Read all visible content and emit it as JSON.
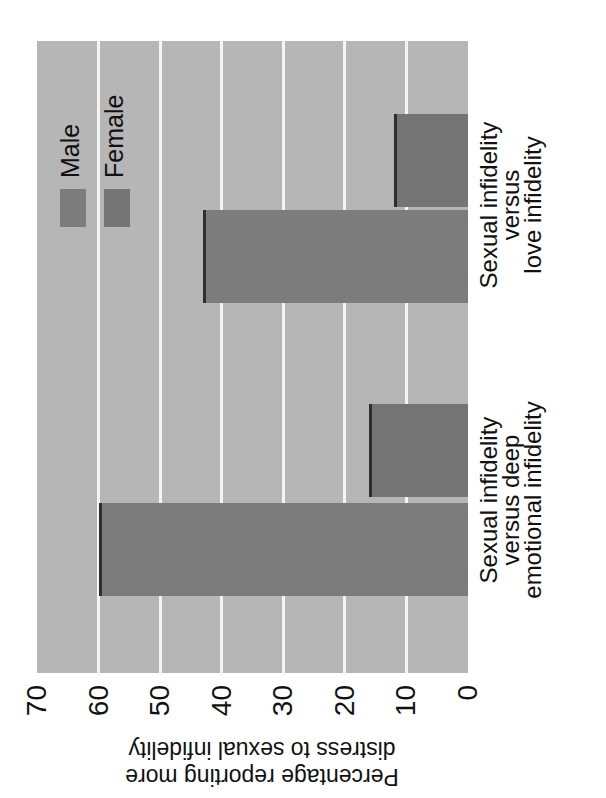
{
  "chart_data": {
    "type": "bar",
    "orientation": "vertical bar chart displayed rotated 90 degrees counter-clockwise",
    "title": "",
    "xlabel": "",
    "ylabel": "Percentage reporting more distress to sexual infidelity",
    "ylabel_lines": [
      "Percentage reporting more",
      "distress to sexual infidelity"
    ],
    "categories": [
      "Sexual infidelity versus deep emotional infidelity",
      "Sexual infidelity versus love infidelity"
    ],
    "category_lines": [
      [
        "Sexual infidelity",
        "versus deep",
        "emotional infidelity"
      ],
      [
        "Sexual infidelity",
        "versus",
        "love infidelity"
      ]
    ],
    "series": [
      {
        "name": "Male",
        "values": [
          60,
          43
        ],
        "color": "#7c7c7c"
      },
      {
        "name": "Female",
        "values": [
          16,
          12
        ],
        "color": "#747474"
      }
    ],
    "ylim": [
      0,
      70
    ],
    "yticks": [
      0,
      10,
      20,
      30,
      40,
      50,
      60,
      70
    ],
    "grid": true,
    "legend_position": "upper right (of unrotated chart)",
    "plot_background": "#b6b6b6",
    "gridline_color": "#f4f4f4"
  },
  "legend": {
    "items": [
      {
        "label": "Male",
        "color": "#7c7c7c"
      },
      {
        "label": "Female",
        "color": "#747474"
      }
    ]
  },
  "axis": {
    "title_line1": "Percentage reporting more",
    "title_line2": "distress to sexual infidelity",
    "ticks": [
      "0",
      "10",
      "20",
      "30",
      "40",
      "50",
      "60",
      "70"
    ]
  },
  "categories": [
    {
      "line1": "Sexual infidelity",
      "line2": "versus deep",
      "line3": "emotional infidelity"
    },
    {
      "line1": "Sexual infidelity",
      "line2": "versus",
      "line3": "love infidelity"
    }
  ]
}
